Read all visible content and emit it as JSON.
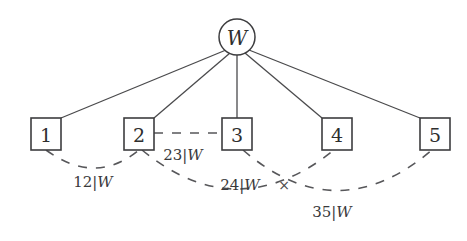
{
  "figure": {
    "type": "graph-diagram",
    "background_color": "#ffffff",
    "line_color": "#4a4a4c",
    "text_color": "#2e2e2e"
  },
  "root_node": {
    "label": "W",
    "shape": "circle",
    "cx": 237,
    "cy": 37,
    "r": 18
  },
  "nodes": [
    {
      "label": "1",
      "shape": "square",
      "x": 31,
      "y": 118,
      "w": 30,
      "h": 32
    },
    {
      "label": "2",
      "shape": "square",
      "x": 124,
      "y": 118,
      "w": 30,
      "h": 32
    },
    {
      "label": "3",
      "shape": "square",
      "x": 222,
      "y": 118,
      "w": 30,
      "h": 32
    },
    {
      "label": "4",
      "shape": "square",
      "x": 322,
      "y": 118,
      "w": 30,
      "h": 32
    },
    {
      "label": "5",
      "shape": "square",
      "x": 420,
      "y": 118,
      "w": 30,
      "h": 32
    }
  ],
  "solid_edges": [
    {
      "from": "W",
      "to": "1",
      "x1": 226,
      "y1": 50,
      "x2": 61,
      "y2": 118
    },
    {
      "from": "W",
      "to": "2",
      "x1": 230,
      "y1": 53,
      "x2": 154,
      "y2": 118
    },
    {
      "from": "W",
      "to": "3",
      "x1": 237,
      "y1": 55,
      "x2": 237,
      "y2": 118
    },
    {
      "from": "W",
      "to": "4",
      "x1": 245,
      "y1": 53,
      "x2": 322,
      "y2": 118
    },
    {
      "from": "W",
      "to": "5",
      "x1": 249,
      "y1": 50,
      "x2": 420,
      "y2": 118
    }
  ],
  "dashed_edges": [
    {
      "id": "edge-1-2",
      "from": "1",
      "to": "2",
      "label": "12|W",
      "label_number": "12",
      "label_condition": "W",
      "path": "M 46 150 Q 95 186 139 150",
      "label_x": 93,
      "label_y": 182
    },
    {
      "id": "edge-2-3",
      "from": "2",
      "to": "3",
      "label": "23|W",
      "label_number": "23",
      "label_condition": "W",
      "path": "M 154 133 L 222 133",
      "label_x": 183,
      "label_y": 155
    },
    {
      "id": "edge-2-4",
      "from": "2",
      "to": "4",
      "label": "24|W",
      "label_number": "24",
      "label_condition": "W",
      "path": "M 142 150 Q 237 228 334 150",
      "label_x": 240,
      "label_y": 185
    },
    {
      "id": "edge-3-5",
      "from": "3",
      "to": "5",
      "label": "35|W",
      "label_number": "35",
      "label_condition": "W",
      "path": "M 243 150 Q 337 231 432 150",
      "label_x": 332,
      "label_y": 212
    }
  ],
  "markers": [
    {
      "id": "crossing-mark",
      "symbol": "×",
      "x": 284,
      "y": 185
    }
  ]
}
